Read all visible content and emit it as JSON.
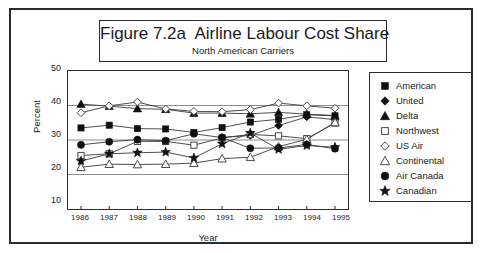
{
  "figure": {
    "title": "Figure 7.2a  Airline Labour Cost Share",
    "subtitle": "North American Carriers"
  },
  "axes": {
    "ylabel": "Percent",
    "xlabel": "Year",
    "yticks": [
      "50",
      "40",
      "30",
      "20",
      "10"
    ],
    "xticks": [
      "1986",
      "1987",
      "1988",
      "1989",
      "1990",
      "1991",
      "1992",
      "1993",
      "1994",
      "1995"
    ]
  },
  "legend": {
    "items": [
      {
        "label": "American",
        "marker": "filled-square-icon"
      },
      {
        "label": "United",
        "marker": "filled-diamond-icon"
      },
      {
        "label": "Delta",
        "marker": "filled-triangle-icon"
      },
      {
        "label": "Northwest",
        "marker": "open-square-icon"
      },
      {
        "label": "US Air",
        "marker": "open-diamond-icon"
      },
      {
        "label": "Continental",
        "marker": "open-triangle-icon"
      },
      {
        "label": "Air Canada",
        "marker": "filled-circle-icon"
      },
      {
        "label": "Canadian",
        "marker": "filled-star-icon"
      }
    ]
  },
  "colors": {
    "line": "#3a3a3a",
    "marker_fill": "#111111",
    "marker_open": "#ffffff",
    "grid": "#8c8c8c",
    "frame": "#2b2b2b",
    "text": "#1a1a1a"
  },
  "chart_data": {
    "type": "line",
    "title": "Figure 7.2a  Airline Labour Cost Share",
    "subtitle": "North American Carriers",
    "xlabel": "Year",
    "ylabel": "Percent",
    "x": [
      1986,
      1987,
      1988,
      1989,
      1990,
      1991,
      1992,
      1993,
      1994,
      1995
    ],
    "ylim": [
      10,
      50
    ],
    "yticks": [
      10,
      20,
      30,
      40,
      50
    ],
    "grid": "horizontal",
    "legend_position": "right-outside",
    "series": [
      {
        "name": "American",
        "marker": "filled-square",
        "values": [
          33.5,
          34.3,
          33.3,
          33.2,
          32.2,
          33.6,
          35.2,
          36.0,
          37.3,
          37.0
        ]
      },
      {
        "name": "United",
        "marker": "filled-diamond",
        "values": [
          null,
          null,
          null,
          null,
          null,
          30.8,
          31.3,
          34.2,
          36.7,
          35.9
        ]
      },
      {
        "name": "Delta",
        "marker": "filled-triangle",
        "values": [
          40.4,
          39.8,
          39.1,
          38.9,
          37.8,
          37.8,
          37.6,
          38.0,
          37.5,
          37.1
        ]
      },
      {
        "name": "Northwest",
        "marker": "open-square",
        "values": [
          25.5,
          26.0,
          29.6,
          29.6,
          28.5,
          30.6,
          31.6,
          31.2,
          30.4,
          34.9
        ]
      },
      {
        "name": "US Air",
        "marker": "open-diamond",
        "values": [
          37.9,
          39.9,
          41.0,
          39.0,
          38.3,
          38.2,
          38.8,
          40.7,
          39.9,
          39.2
        ]
      },
      {
        "name": "Continental",
        "marker": "open-triangle",
        "values": [
          22.1,
          23.0,
          22.9,
          23.0,
          23.3,
          24.6,
          25.0,
          28.1,
          30.2,
          35.1
        ]
      },
      {
        "name": "Air Canada",
        "marker": "filled-circle",
        "values": [
          28.6,
          29.5,
          30.1,
          29.8,
          31.8,
          30.7,
          27.6,
          27.7,
          28.7,
          27.5
        ]
      },
      {
        "name": "Canadian",
        "marker": "filled-star",
        "values": [
          23.9,
          26.0,
          26.3,
          26.5,
          24.8,
          28.9,
          32.0,
          27.3,
          28.4,
          27.9
        ]
      }
    ]
  }
}
